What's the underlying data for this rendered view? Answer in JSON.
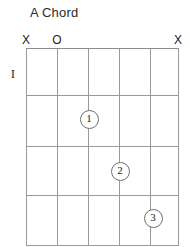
{
  "chart_data": {
    "type": "diagram",
    "title": "A Chord",
    "diagram_kind": "guitar-chord-chart",
    "strings": 6,
    "frets": 4,
    "starting_fret_label": "I",
    "string_x": [
      26,
      57,
      88,
      119,
      150,
      178
    ],
    "fret_y": [
      48,
      95,
      146,
      195,
      245
    ],
    "open_muted": [
      {
        "string": 1,
        "symbol": "X",
        "meaning": "muted"
      },
      {
        "string": 2,
        "symbol": "O",
        "meaning": "open"
      },
      {
        "string": 3,
        "symbol": "",
        "meaning": "none"
      },
      {
        "string": 4,
        "symbol": "",
        "meaning": "none"
      },
      {
        "string": 5,
        "symbol": "",
        "meaning": "none"
      },
      {
        "string": 6,
        "symbol": "X",
        "meaning": "muted"
      }
    ],
    "fingerings": [
      {
        "finger": "1",
        "string": 3,
        "fret": 2,
        "x": 88,
        "y": 118
      },
      {
        "finger": "2",
        "string": 4,
        "fret": 3,
        "x": 119,
        "y": 170
      },
      {
        "finger": "3",
        "string": 5,
        "fret": 4,
        "x": 152,
        "y": 217
      }
    ],
    "colors": {
      "background": "#ffffff",
      "grid": "#9a9a9a",
      "text": "#1d1d1d",
      "dot_border": "#6f6f6f",
      "dot_fill": "#ffffff"
    }
  },
  "diagram": {
    "title": "A Chord",
    "fret_indicator": "I",
    "markers": [
      {
        "label": "X",
        "x": 26,
        "state": "muted"
      },
      {
        "label": "O",
        "x": 57,
        "state": "open"
      },
      {
        "label": "",
        "x": 88,
        "state": "none"
      },
      {
        "label": "",
        "x": 119,
        "state": "none"
      },
      {
        "label": "",
        "x": 150,
        "state": "none"
      },
      {
        "label": "X",
        "x": 178,
        "state": "muted"
      }
    ],
    "dots": [
      {
        "label": "1",
        "x": 88,
        "y": 118
      },
      {
        "label": "2",
        "x": 119,
        "y": 170
      },
      {
        "label": "3",
        "x": 152,
        "y": 217
      }
    ]
  }
}
